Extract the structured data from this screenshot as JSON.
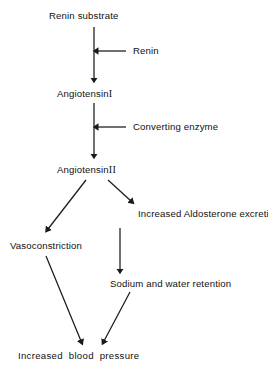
{
  "diagram": {
    "nodes": {
      "renin_substrate": "Renin substrate",
      "angiotensin_1_name": "Angiotensin",
      "angiotensin_1_numeral": "I",
      "angiotensin_2_name": "Angiotensin",
      "angiotensin_2_numeral": "II",
      "vasoconstriction": "Vasoconstriction",
      "aldosterone": "Increased Aldosterone excretion",
      "sodium_water": "Sodium and water retention",
      "blood_pressure": "Increased blood pressure"
    },
    "edge_labels": {
      "renin": "Renin",
      "converting_enzyme": "Converting enzyme"
    },
    "style": {
      "line_color": "#1a1a1a",
      "text_color": "#111111",
      "background": "#ffffff"
    }
  }
}
